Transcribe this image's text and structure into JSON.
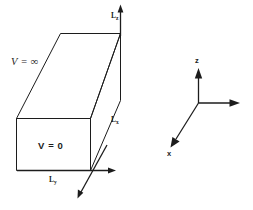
{
  "figure": {
    "background_color": "#ffffff",
    "line_color": "#1c1c1c",
    "width": 253,
    "height": 210
  },
  "box": {
    "potential_outside_label": "V = ∞",
    "potential_inside_label": "V = 0",
    "edge_labels": [
      {
        "name": "height-edge",
        "symbol": "L",
        "subscript": "z"
      },
      {
        "name": "depth-edge",
        "symbol": "L",
        "subscript": "x"
      },
      {
        "name": "width-edge",
        "symbol": "L",
        "subscript": "y"
      }
    ]
  },
  "axes": {
    "vertical_label": "z",
    "diagonal_label": "x",
    "horizontal_label": ""
  }
}
